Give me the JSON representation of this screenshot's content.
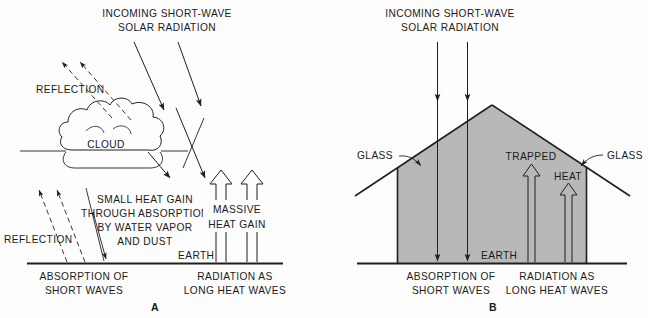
{
  "figure": {
    "background_color": "#fdfdfd",
    "ink_color": "#1f1f1f",
    "greenhouse_fill_color": "#b8b8b8"
  },
  "panel_a": {
    "letter": "A",
    "heading_line1": "INCOMING SHORT-WAVE",
    "heading_line2": "SOLAR RADIATION",
    "reflection_top_label": "REFLECTION",
    "cloud_label": "CLOUD",
    "reflection_bottom_label": "REFLECTION",
    "absorption_line1": "SMALL HEAT GAIN",
    "absorption_line2": "THROUGH ABSORPTION",
    "absorption_line3": "BY WATER VAPOR",
    "absorption_line4": "AND DUST",
    "massive_line1": "MASSIVE",
    "massive_line2": "HEAT GAIN",
    "earth_label": "EARTH",
    "ground_left_line1": "ABSORPTION OF",
    "ground_left_line2": "SHORT WAVES",
    "ground_right_line1": "RADIATION AS",
    "ground_right_line2": "LONG HEAT WAVES"
  },
  "panel_b": {
    "letter": "B",
    "heading_line1": "INCOMING SHORT-WAVE",
    "heading_line2": "SOLAR RADIATION",
    "glass_left_label": "GLASS",
    "glass_right_label": "GLASS",
    "trapped_label": "TRAPPED",
    "heat_label": "HEAT",
    "earth_label": "EARTH",
    "ground_left_line1": "ABSORPTION OF",
    "ground_left_line2": "SHORT WAVES",
    "ground_right_line1": "RADIATION AS",
    "ground_right_line2": "LONG HEAT WAVES"
  }
}
